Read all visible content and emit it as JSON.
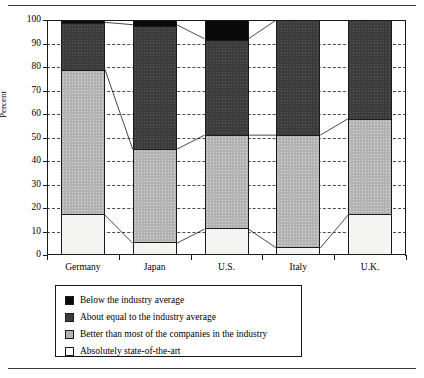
{
  "figure": {
    "top_caption": "",
    "ylabel": "Percent"
  },
  "chart_data": {
    "type": "bar",
    "stacked": true,
    "stack_normalized": true,
    "title": "",
    "xlabel": "",
    "ylabel": "Percent",
    "ylim": [
      0,
      100
    ],
    "ytick_values": [
      0,
      10,
      20,
      30,
      40,
      50,
      60,
      70,
      80,
      90,
      100
    ],
    "ytick_labels": [
      "0",
      "10",
      "20",
      "30",
      "40",
      "50",
      "60",
      "70",
      "80",
      "90",
      "100"
    ],
    "grid": "horizontal-dashed",
    "legend_position": "below-plot",
    "categories": [
      "Germany",
      "Japan",
      "U.S.",
      "Italy",
      "U.K."
    ],
    "series": [
      {
        "name": "Below the industry average",
        "key": "below",
        "color": "#0a0a0a",
        "values": [
          1,
          2,
          8,
          0,
          0
        ]
      },
      {
        "name": "About equal to the industry average",
        "key": "about_equal",
        "color": "#3c3c3c",
        "values": [
          20,
          53,
          41,
          49,
          42
        ]
      },
      {
        "name": "Better than most of the companies in the industry",
        "key": "better_than_most",
        "color": "#b3b3b3",
        "values": [
          62,
          40,
          40,
          48,
          41
        ]
      },
      {
        "name": "Absolutely state-of-the-art",
        "key": "state_of_the_art",
        "color": "#f4f4f2",
        "values": [
          17,
          5,
          11,
          3,
          17
        ]
      }
    ],
    "cumulative_tops": {
      "state_of_the_art": [
        17,
        5,
        11,
        3,
        17
      ],
      "better_than_most": [
        79,
        45,
        51,
        51,
        58
      ],
      "about_equal": [
        99,
        98,
        92,
        100,
        100
      ]
    },
    "annotations": []
  },
  "legend": {
    "items": [
      {
        "label": "Below the industry average",
        "swatch": "swatch-black"
      },
      {
        "label": "About equal to the industry average",
        "swatch": "swatch-dark-gray"
      },
      {
        "label": "Better than most of the companies in the industry",
        "swatch": "swatch-mid-gray"
      },
      {
        "label": "Absolutely state-of-the-art",
        "swatch": "swatch-white"
      }
    ]
  }
}
